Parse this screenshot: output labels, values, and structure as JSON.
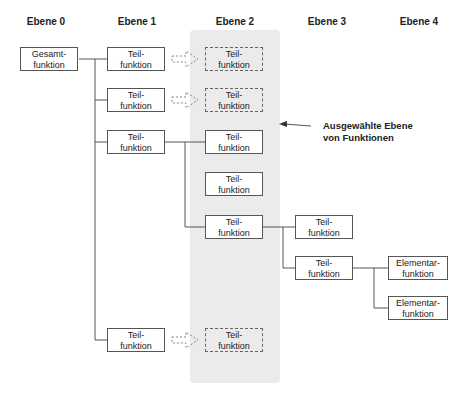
{
  "headers": [
    "Ebene 0",
    "Ebene 1",
    "Ebene 2",
    "Ebene 3",
    "Ebene 4"
  ],
  "nodes": {
    "root": {
      "l1": "Gesamt-",
      "l2": "funktion"
    },
    "teil": {
      "l1": "Teil-",
      "l2": "funktion"
    },
    "elem": {
      "l1": "Elementar-",
      "l2": "funktion"
    }
  },
  "annotation": {
    "line1": "Ausgewählte Ebene",
    "line2": "von Funktionen"
  },
  "colors": {
    "highlight": "#ebebeb",
    "line": "#555555"
  }
}
